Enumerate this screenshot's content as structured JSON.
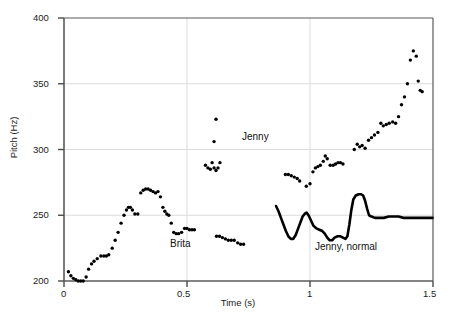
{
  "chart_data": {
    "type": "scatter",
    "title": "",
    "xlabel": "Time (s)",
    "ylabel": "Pitch (Hz)",
    "xlim": [
      0,
      1.5
    ],
    "ylim": [
      200,
      400
    ],
    "xticks": [
      0,
      0.5,
      1,
      1.5
    ],
    "xticklabels": [
      "0",
      "0.5",
      "1",
      "1.5"
    ],
    "yticks": [
      200,
      250,
      300,
      350,
      400
    ],
    "yticklabels": [
      "200",
      "250",
      "300",
      "350",
      "400"
    ],
    "grid": "light gray gridlines at x=0.5, x=1 and y=250, y=300, y=350",
    "legend": "inline annotations",
    "annotations": [
      {
        "text": "Brita",
        "x": 0.44,
        "y": 227
      },
      {
        "text": "Jenny",
        "x": 0.78,
        "y": 283
      },
      {
        "text": "Jenny, normal",
        "x": 1.12,
        "y": 222
      }
    ],
    "series": [
      {
        "name": "Brita",
        "style": "dots",
        "marker": "filled-circle",
        "color": "#000000",
        "points": [
          [
            0.018,
            207
          ],
          [
            0.028,
            204
          ],
          [
            0.038,
            202
          ],
          [
            0.048,
            201
          ],
          [
            0.058,
            200
          ],
          [
            0.068,
            200
          ],
          [
            0.078,
            200
          ],
          [
            0.09,
            203
          ],
          [
            0.1,
            209
          ],
          [
            0.112,
            213
          ],
          [
            0.122,
            215
          ],
          [
            0.135,
            217
          ],
          [
            0.15,
            219
          ],
          [
            0.162,
            219
          ],
          [
            0.172,
            219
          ],
          [
            0.182,
            220
          ],
          [
            0.196,
            225
          ],
          [
            0.208,
            231
          ],
          [
            0.22,
            237
          ],
          [
            0.232,
            244
          ],
          [
            0.244,
            250
          ],
          [
            0.254,
            254
          ],
          [
            0.262,
            256
          ],
          [
            0.27,
            256
          ],
          [
            0.278,
            254
          ],
          [
            0.288,
            251
          ],
          [
            0.3,
            251
          ],
          [
            0.312,
            267
          ],
          [
            0.322,
            269
          ],
          [
            0.332,
            270
          ],
          [
            0.342,
            270
          ],
          [
            0.352,
            269
          ],
          [
            0.362,
            268
          ],
          [
            0.372,
            267
          ],
          [
            0.382,
            268
          ],
          [
            0.392,
            264
          ],
          [
            0.402,
            256
          ],
          [
            0.41,
            253
          ],
          [
            0.418,
            251
          ],
          [
            0.426,
            250
          ],
          [
            0.436,
            244
          ],
          [
            0.446,
            237
          ],
          [
            0.456,
            236
          ],
          [
            0.466,
            236
          ],
          [
            0.478,
            237
          ],
          [
            0.49,
            240
          ],
          [
            0.5,
            240
          ],
          [
            0.51,
            239
          ],
          [
            0.52,
            239
          ],
          [
            0.53,
            239
          ],
          [
            0.62,
            234
          ],
          [
            0.632,
            234
          ],
          [
            0.644,
            233
          ],
          [
            0.656,
            232
          ],
          [
            0.668,
            231
          ],
          [
            0.68,
            231
          ],
          [
            0.692,
            231
          ],
          [
            0.706,
            229
          ],
          [
            0.718,
            228
          ],
          [
            0.73,
            228
          ]
        ]
      },
      {
        "name": "Jenny",
        "style": "dots",
        "marker": "filled-circle",
        "color": "#000000",
        "points": [
          [
            0.575,
            288
          ],
          [
            0.585,
            286
          ],
          [
            0.595,
            285
          ],
          [
            0.602,
            290
          ],
          [
            0.61,
            286
          ],
          [
            0.618,
            284
          ],
          [
            0.626,
            286
          ],
          [
            0.634,
            290
          ],
          [
            0.61,
            306
          ],
          [
            0.618,
            323
          ],
          [
            0.9,
            281
          ],
          [
            0.912,
            281
          ],
          [
            0.924,
            280
          ],
          [
            0.936,
            279
          ],
          [
            0.948,
            278
          ],
          [
            0.958,
            276
          ],
          [
            0.985,
            272
          ],
          [
            1.0,
            274
          ],
          [
            1.012,
            283
          ],
          [
            1.022,
            286
          ],
          [
            1.032,
            287
          ],
          [
            1.042,
            288
          ],
          [
            1.054,
            291
          ],
          [
            1.062,
            295
          ],
          [
            1.07,
            293
          ],
          [
            1.082,
            288
          ],
          [
            1.094,
            288
          ],
          [
            1.104,
            289
          ],
          [
            1.114,
            290
          ],
          [
            1.124,
            290
          ],
          [
            1.134,
            289
          ],
          [
            1.18,
            300
          ],
          [
            1.192,
            304
          ],
          [
            1.202,
            302
          ],
          [
            1.212,
            303
          ],
          [
            1.224,
            301
          ],
          [
            1.238,
            307
          ],
          [
            1.25,
            309
          ],
          [
            1.262,
            311
          ],
          [
            1.276,
            313
          ],
          [
            1.288,
            320
          ],
          [
            1.298,
            318
          ],
          [
            1.31,
            319
          ],
          [
            1.322,
            320
          ],
          [
            1.336,
            321
          ],
          [
            1.348,
            320
          ],
          [
            1.36,
            325
          ],
          [
            1.372,
            334
          ],
          [
            1.384,
            340
          ],
          [
            1.396,
            350
          ],
          [
            1.408,
            368
          ],
          [
            1.42,
            375
          ],
          [
            1.432,
            371
          ],
          [
            1.44,
            352
          ],
          [
            1.448,
            345
          ],
          [
            1.456,
            344
          ]
        ]
      },
      {
        "name": "Jenny, normal",
        "style": "line",
        "linewidth": 2.6,
        "color": "#000000",
        "points": [
          [
            0.862,
            257
          ],
          [
            0.872,
            253
          ],
          [
            0.882,
            248
          ],
          [
            0.892,
            243
          ],
          [
            0.902,
            238
          ],
          [
            0.912,
            234
          ],
          [
            0.922,
            232
          ],
          [
            0.932,
            232
          ],
          [
            0.942,
            235
          ],
          [
            0.952,
            240
          ],
          [
            0.962,
            245
          ],
          [
            0.97,
            249
          ],
          [
            0.978,
            251
          ],
          [
            0.986,
            252
          ],
          [
            0.994,
            250
          ],
          [
            1.004,
            246
          ],
          [
            1.014,
            242
          ],
          [
            1.026,
            240
          ],
          [
            1.038,
            239
          ],
          [
            1.05,
            238
          ],
          [
            1.06,
            236
          ],
          [
            1.07,
            233
          ],
          [
            1.08,
            231
          ],
          [
            1.09,
            231
          ],
          [
            1.1,
            233
          ],
          [
            1.112,
            234
          ],
          [
            1.124,
            234
          ],
          [
            1.134,
            233
          ],
          [
            1.144,
            232
          ],
          [
            1.152,
            234
          ],
          [
            1.16,
            243
          ],
          [
            1.168,
            254
          ],
          [
            1.176,
            262
          ],
          [
            1.186,
            265
          ],
          [
            1.198,
            266
          ],
          [
            1.208,
            266
          ],
          [
            1.216,
            265
          ],
          [
            1.224,
            261
          ],
          [
            1.232,
            255
          ],
          [
            1.24,
            250
          ],
          [
            1.25,
            249
          ],
          [
            1.264,
            248
          ],
          [
            1.28,
            248
          ],
          [
            1.3,
            248
          ],
          [
            1.32,
            249
          ],
          [
            1.34,
            249
          ],
          [
            1.36,
            249
          ],
          [
            1.38,
            248
          ],
          [
            1.4,
            248
          ],
          [
            1.42,
            248
          ],
          [
            1.44,
            248
          ],
          [
            1.46,
            248
          ],
          [
            1.48,
            248
          ],
          [
            1.498,
            248
          ]
        ]
      }
    ]
  },
  "axes": {
    "ylabel_text": "Pitch (Hz)",
    "xlabel_text": "Time (s)",
    "ytick_200": "200",
    "ytick_250": "250",
    "ytick_300": "300",
    "ytick_350": "350",
    "ytick_400": "400",
    "xtick_0": "0",
    "xtick_05": "0.5",
    "xtick_1": "1",
    "xtick_15": "1.5"
  },
  "annotations": {
    "brita": "Brita",
    "jenny": "Jenny",
    "jenny_normal": "Jenny, normal"
  },
  "colors": {
    "data": "#000000",
    "axis": "#555555",
    "grid": "#d8d8d8",
    "background": "#ffffff"
  }
}
